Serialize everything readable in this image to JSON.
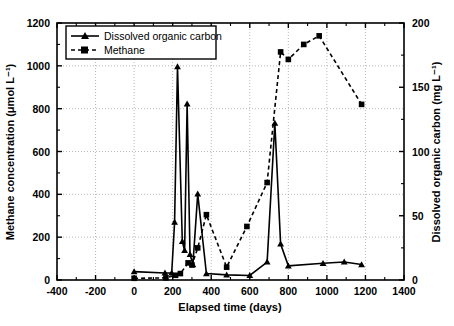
{
  "chart_data": {
    "type": "line",
    "title": "",
    "xlabel": "Elapsed time (days)",
    "ylabel": "Methane concentration (μmol L⁻¹)",
    "y2label": "Dissolved organic carbon (mg L⁻¹)",
    "xlim": [
      -400,
      1400
    ],
    "ylim": [
      0,
      1200
    ],
    "y2lim": [
      0,
      200
    ],
    "xticks": [
      -400,
      -200,
      0,
      200,
      400,
      600,
      800,
      1000,
      1200,
      1400
    ],
    "yticks": [
      0,
      200,
      400,
      600,
      800,
      1000,
      1200
    ],
    "y2ticks": [
      0,
      50,
      100,
      150,
      200
    ],
    "xtick_labels": [
      "-400",
      "-200",
      "0",
      "200",
      "400",
      "600",
      "800",
      "1000",
      "1200",
      "1400"
    ],
    "ytick_labels": [
      "0",
      "200",
      "400",
      "600",
      "800",
      "1000",
      "1200"
    ],
    "y2tick_labels": [
      "0",
      "50",
      "100",
      "150",
      "200"
    ],
    "grid": true,
    "grid_style": "dotted",
    "minor_ticks": true,
    "legend_position": "top-left",
    "series": [
      {
        "name": "Dissolved organic carbon",
        "axis": "right",
        "units": "mg L⁻¹",
        "line_style": "solid",
        "marker": "triangle",
        "color": "#000000",
        "x": [
          0,
          160,
          195,
          210,
          225,
          250,
          262,
          275,
          290,
          305,
          330,
          375,
          480,
          600,
          690,
          730,
          760,
          800,
          980,
          1090,
          1180
        ],
        "y": [
          6.5,
          5.5,
          5.5,
          45,
          166,
          30,
          23,
          137,
          20,
          12,
          67,
          5,
          4,
          3.5,
          14,
          122,
          28,
          11,
          13,
          14,
          12
        ]
      },
      {
        "name": "Methane",
        "axis": "left",
        "units": "μmol L⁻¹",
        "line_style": "dashed",
        "marker": "square",
        "color": "#000000",
        "x": [
          0,
          165,
          215,
          240,
          280,
          300,
          330,
          375,
          480,
          585,
          690,
          760,
          800,
          880,
          960,
          1180
        ],
        "y": [
          8,
          10,
          22,
          30,
          80,
          70,
          150,
          305,
          60,
          250,
          455,
          1065,
          1030,
          1100,
          1140,
          820
        ]
      }
    ]
  },
  "legend": {
    "items": [
      {
        "label": "Dissolved organic carbon",
        "marker": "triangle",
        "line": "solid"
      },
      {
        "label": "Methane",
        "marker": "square",
        "line": "dashed"
      }
    ]
  }
}
